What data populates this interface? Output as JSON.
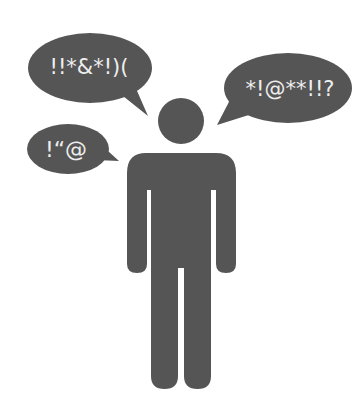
{
  "illustration": {
    "subject": "person-silhouette",
    "colors": {
      "fill": "#555555",
      "text": "#eeeeee",
      "background": "#ffffff"
    },
    "bubbles": [
      {
        "id": "top-left",
        "text": "!!*&*!)("
      },
      {
        "id": "right",
        "text": "*!@**!!?"
      },
      {
        "id": "left",
        "text": "!“@"
      }
    ]
  }
}
